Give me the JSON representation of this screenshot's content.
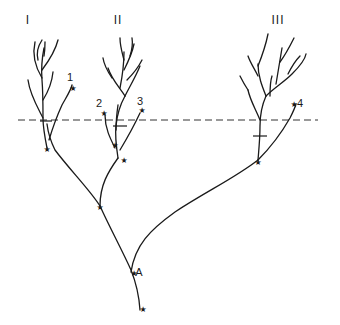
{
  "diagram": {
    "type": "phylogenetic-tree",
    "clade_labels": [
      {
        "id": "I",
        "text": "I",
        "x": 28,
        "y": 24
      },
      {
        "id": "II",
        "text": "II",
        "x": 118,
        "y": 24
      },
      {
        "id": "III",
        "text": "III",
        "x": 278,
        "y": 24
      }
    ],
    "tip_labels": [
      {
        "id": "1",
        "text": "1",
        "x": 70,
        "y": 81
      },
      {
        "id": "2",
        "text": "2",
        "x": 99,
        "y": 107
      },
      {
        "id": "3",
        "text": "3",
        "x": 140,
        "y": 105
      },
      {
        "id": "4",
        "text": "4",
        "x": 300,
        "y": 107
      }
    ],
    "node_labels": [
      {
        "id": "A",
        "text": "A",
        "x": 139,
        "y": 276
      }
    ],
    "star_glyph": "★",
    "stars": [
      {
        "x": 73,
        "y": 88
      },
      {
        "x": 104,
        "y": 113
      },
      {
        "x": 142,
        "y": 110
      },
      {
        "x": 294,
        "y": 104
      },
      {
        "x": 47,
        "y": 149
      },
      {
        "x": 115,
        "y": 145
      },
      {
        "x": 124,
        "y": 160
      },
      {
        "x": 100,
        "y": 207
      },
      {
        "x": 134,
        "y": 273
      },
      {
        "x": 143,
        "y": 309
      },
      {
        "x": 258,
        "y": 162
      }
    ],
    "threshold_line": {
      "style": "dashed",
      "x1": 18,
      "x2": 318,
      "y": 120
    },
    "crossbars": [
      {
        "x1": 40,
        "x2": 52,
        "y": 121
      },
      {
        "x1": 113,
        "x2": 127,
        "y": 126
      },
      {
        "x1": 253,
        "x2": 267,
        "y": 136
      }
    ]
  }
}
